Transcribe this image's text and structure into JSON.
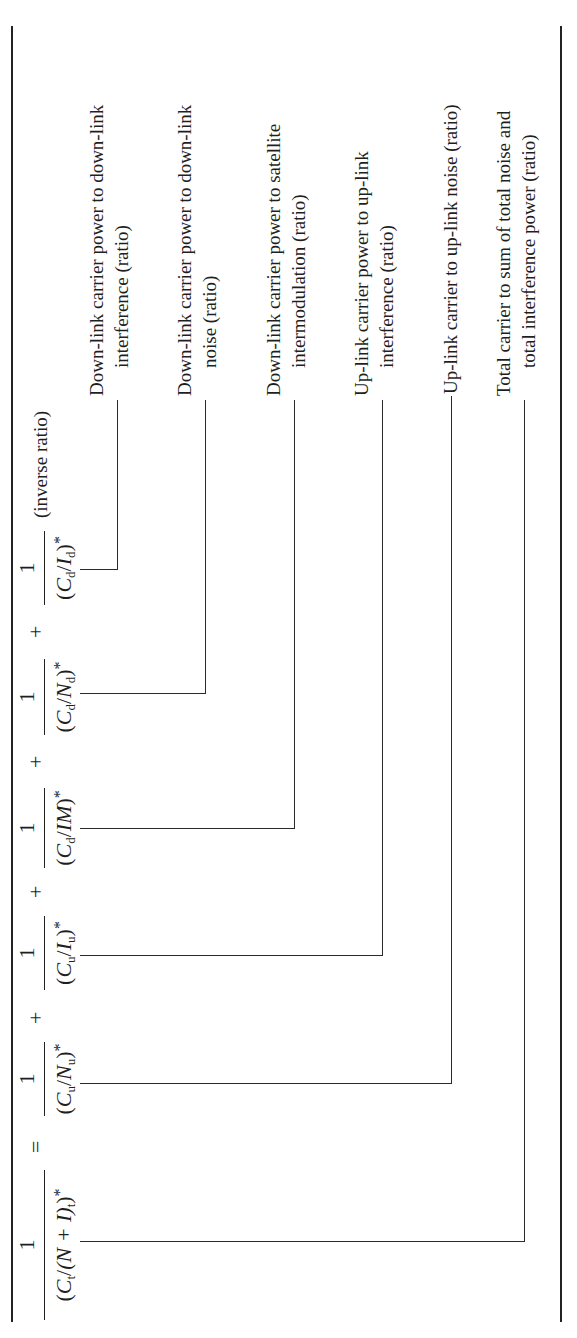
{
  "equation": {
    "lhs": {
      "numerator": "1",
      "denominator": {
        "open": "(",
        "C": "C",
        "C_sub": "t",
        "slash": "/",
        "inner": "(N + I)",
        "inner_sub": "t",
        "close": ")",
        "star": "*"
      }
    },
    "equals": "=",
    "plus": "+",
    "terms": [
      {
        "numerator": "1",
        "den_var1": "C",
        "den_sub1": "u",
        "den_var2": "N",
        "den_sub2": "u",
        "star": "*"
      },
      {
        "numerator": "1",
        "den_var1": "C",
        "den_sub1": "u",
        "den_var2": "I",
        "den_sub2": "u",
        "star": "*"
      },
      {
        "numerator": "1",
        "den_var1": "C",
        "den_sub1": "d",
        "den_var2": "IM",
        "den_sub2": "",
        "star": "*"
      },
      {
        "numerator": "1",
        "den_var1": "C",
        "den_sub1": "d",
        "den_var2": "N",
        "den_sub2": "d",
        "star": "*"
      },
      {
        "numerator": "1",
        "den_var1": "C",
        "den_sub1": "d",
        "den_var2": "I",
        "den_sub2": "d",
        "star": "*"
      }
    ],
    "note": "(inverse ratio)"
  },
  "labels": [
    {
      "line1": "Down-link carrier power to down-link",
      "line2": "interference (ratio)"
    },
    {
      "line1": "Down-link carrier power to down-link",
      "line2": "noise (ratio)"
    },
    {
      "line1": "Down-link carrier power to satellite",
      "line2": "intermodulation (ratio)"
    },
    {
      "line1": "Up-link carrier power to up-link",
      "line2": "interference (ratio)"
    },
    {
      "line1": "Up-link carrier to up-link noise (ratio)",
      "line2": ""
    },
    {
      "line1": "Total carrier to sum of total noise and",
      "line2": "total interference power (ratio)"
    }
  ],
  "symbols": {
    "open_paren": "(",
    "close_paren": ")",
    "slash": "/"
  }
}
